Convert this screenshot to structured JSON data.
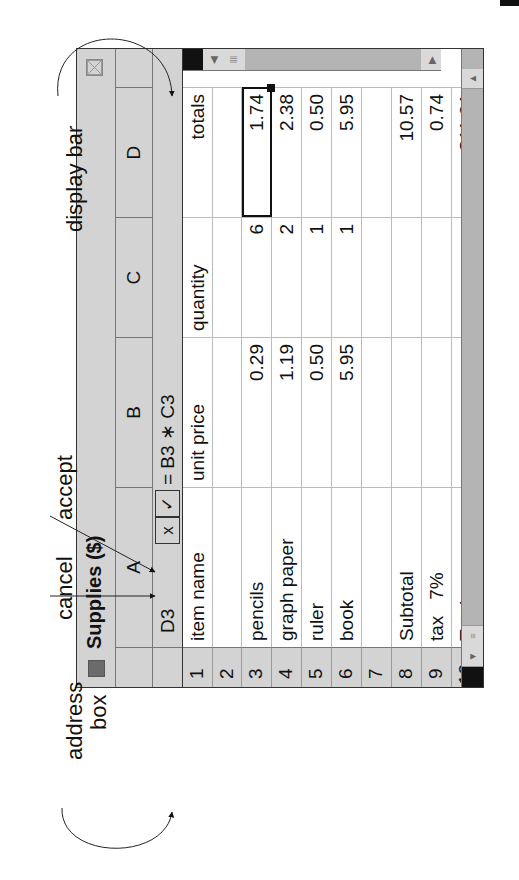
{
  "window": {
    "title": "Supplies ($)",
    "title_icon": "window-square-icon",
    "close_icon": "close-box-icon"
  },
  "columns": [
    {
      "id": "A",
      "label": "A"
    },
    {
      "id": "B",
      "label": "B"
    },
    {
      "id": "C",
      "label": "C"
    },
    {
      "id": "D",
      "label": "D"
    }
  ],
  "formula_bar": {
    "address": "D3",
    "cancel_label": "x",
    "accept_label": "✓",
    "formula": "= B3 ∗ C3"
  },
  "rows": [
    {
      "num": "1",
      "cells": [
        "item name",
        "unit price",
        "quantity",
        "totals"
      ]
    },
    {
      "num": "2",
      "cells": [
        "",
        "",
        "",
        ""
      ]
    },
    {
      "num": "3",
      "cells": [
        "pencils",
        "0.29",
        "6",
        "1.74"
      ]
    },
    {
      "num": "4",
      "cells": [
        "graph paper",
        "1.19",
        "2",
        "2.38"
      ]
    },
    {
      "num": "5",
      "cells": [
        "ruler",
        "0.50",
        "1",
        "0.50"
      ]
    },
    {
      "num": "6",
      "cells": [
        "book",
        "5.95",
        "1",
        "5.95"
      ]
    },
    {
      "num": "7",
      "cells": [
        "",
        "",
        "",
        ""
      ]
    },
    {
      "num": "8",
      "cells": [
        "Subtotal",
        "",
        "",
        "10.57"
      ]
    },
    {
      "num": "9",
      "cells": [
        "tax   7%",
        "",
        "",
        "0.74"
      ]
    },
    {
      "num": "10",
      "cells": [
        "Total",
        "",
        "",
        "$11.31"
      ]
    }
  ],
  "selected_cell": "D3",
  "annotations": {
    "address_box": "address box",
    "address_box_line1": "address",
    "address_box_line2": "box",
    "cancel": "cancel",
    "accept": "accept",
    "display_bar": "display bar"
  },
  "colors": {
    "chrome": "#d3d3d3",
    "scrollbar": "#b4b4b4",
    "border": "#333333",
    "grid": "#bbbbbb"
  }
}
